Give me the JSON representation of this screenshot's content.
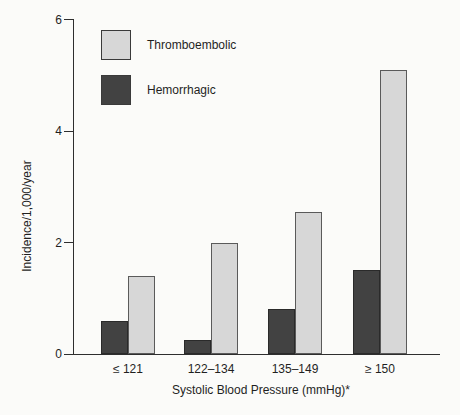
{
  "figure": {
    "background_color": "#fbfbf9",
    "axis_color": "#2e2e2e",
    "text_color": "#1f1f1f"
  },
  "chart_data": {
    "type": "bar",
    "title": "",
    "categories": [
      "≤ 121",
      "122–134",
      "135–149",
      "≥ 150"
    ],
    "series": [
      {
        "name": "Thromboembolic",
        "color": "#d7d7d7",
        "values": [
          1.4,
          2.0,
          2.55,
          5.1
        ]
      },
      {
        "name": "Hemorrhagic",
        "color": "#424242",
        "values": [
          0.6,
          0.25,
          0.8,
          1.5
        ]
      }
    ],
    "group_order_left_to_right": [
      "Hemorrhagic",
      "Thromboembolic"
    ],
    "xlabel": "Systolic Blood Pressure (mmHg)*",
    "ylabel": "Incidence/1,000/year",
    "ylim": [
      0,
      6
    ],
    "yticks": [
      0,
      2,
      4,
      6
    ],
    "grid": false,
    "legend_position": "upper-left-inside"
  }
}
